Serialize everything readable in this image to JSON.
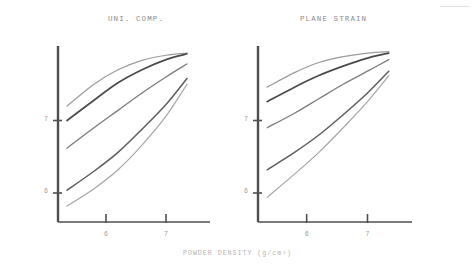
{
  "figure": {
    "background": "#ffffff",
    "ink_color": "#5a5a5a",
    "faded_ink_color": "#9a9a9a",
    "panels": [
      {
        "id": "left",
        "title": "UNI. COMP."
      },
      {
        "id": "right",
        "title": "PLANE STRAIN"
      }
    ],
    "x_axis_label": "POWDER DENSITY (g/cm³)",
    "y_axis_label": "SOUND VELOCITY (m/s×10⁻³)"
  },
  "chart_data": [
    {
      "type": "line",
      "title": "UNI. COMP.",
      "xlabel": "POWDER DENSITY (g/cm³)",
      "ylabel": "SOUND VELOCITY (m/s×10⁻³)",
      "xlim": [
        5.2,
        7.6
      ],
      "ylim": [
        5.6,
        8.0
      ],
      "xticks": [
        6,
        7
      ],
      "xticklabels": [
        "6",
        "7"
      ],
      "yticks": [
        6,
        7
      ],
      "yticklabels": [
        "6",
        "7"
      ],
      "grid": false,
      "legend": "none",
      "series": [
        {
          "name": "curve-1",
          "x": [
            5.35,
            5.8,
            6.2,
            6.6,
            7.0,
            7.35
          ],
          "y": [
            7.2,
            7.5,
            7.7,
            7.83,
            7.9,
            7.93
          ]
        },
        {
          "name": "curve-2",
          "x": [
            5.35,
            5.8,
            6.2,
            6.6,
            7.0,
            7.35
          ],
          "y": [
            7.0,
            7.28,
            7.52,
            7.7,
            7.84,
            7.92
          ]
        },
        {
          "name": "curve-3",
          "x": [
            5.35,
            5.8,
            6.2,
            6.6,
            7.0,
            7.35
          ],
          "y": [
            6.62,
            6.9,
            7.14,
            7.38,
            7.6,
            7.78
          ]
        },
        {
          "name": "curve-4",
          "x": [
            5.35,
            5.8,
            6.2,
            6.6,
            7.0,
            7.35
          ],
          "y": [
            6.04,
            6.3,
            6.56,
            6.88,
            7.22,
            7.58
          ]
        },
        {
          "name": "curve-5",
          "x": [
            5.35,
            5.8,
            6.2,
            6.6,
            7.0,
            7.35
          ],
          "y": [
            5.82,
            6.06,
            6.32,
            6.66,
            7.06,
            7.5
          ]
        }
      ]
    },
    {
      "type": "line",
      "title": "PLANE STRAIN",
      "xlabel": "POWDER DENSITY (g/cm³)",
      "ylabel": "SOUND VELOCITY (m/s×10⁻³)",
      "xlim": [
        5.2,
        7.6
      ],
      "ylim": [
        5.6,
        8.0
      ],
      "xticks": [
        6,
        7
      ],
      "xticklabels": [
        "6",
        "7"
      ],
      "yticks": [
        6,
        7
      ],
      "yticklabels": [
        "6",
        "7"
      ],
      "grid": false,
      "legend": "none",
      "series": [
        {
          "name": "curve-1",
          "x": [
            5.35,
            5.8,
            6.2,
            6.6,
            7.0,
            7.35
          ],
          "y": [
            7.46,
            7.66,
            7.8,
            7.88,
            7.93,
            7.95
          ]
        },
        {
          "name": "curve-2",
          "x": [
            5.35,
            5.8,
            6.2,
            6.6,
            7.0,
            7.35
          ],
          "y": [
            7.26,
            7.46,
            7.62,
            7.75,
            7.86,
            7.93
          ]
        },
        {
          "name": "curve-3",
          "x": [
            5.35,
            5.8,
            6.2,
            6.6,
            7.0,
            7.35
          ],
          "y": [
            6.9,
            7.1,
            7.3,
            7.5,
            7.68,
            7.84
          ]
        },
        {
          "name": "curve-4",
          "x": [
            5.35,
            5.8,
            6.2,
            6.6,
            7.0,
            7.35
          ],
          "y": [
            6.32,
            6.56,
            6.8,
            7.08,
            7.38,
            7.68
          ]
        },
        {
          "name": "curve-5",
          "x": [
            5.35,
            5.8,
            6.2,
            6.6,
            7.0,
            7.35
          ],
          "y": [
            5.94,
            6.26,
            6.56,
            6.9,
            7.26,
            7.62
          ]
        }
      ]
    }
  ]
}
